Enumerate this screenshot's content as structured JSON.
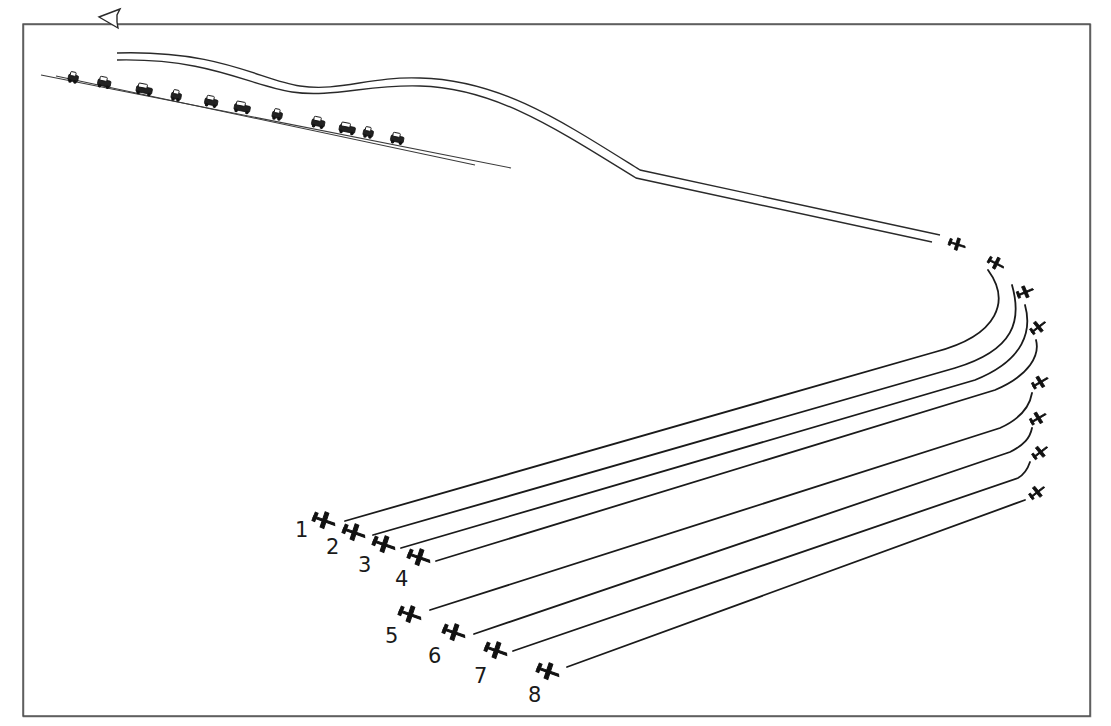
{
  "diagram": {
    "type": "line-art illustration",
    "colors": {
      "ink": "#111111",
      "frame": "#4a4a4a",
      "background": "#ffffff"
    },
    "frame": {
      "x": 23,
      "y": 24,
      "width": 1067,
      "height": 692
    },
    "road": {
      "lines": [
        {
          "x1": 41,
          "y1": 75,
          "x2": 511,
          "y2": 168
        },
        {
          "x1": 56,
          "y1": 76,
          "x2": 475,
          "y2": 165
        }
      ],
      "vehicle_count": 12,
      "vehicles": [
        {
          "x": 73,
          "y": 79
        },
        {
          "x": 104,
          "y": 84
        },
        {
          "x": 144,
          "y": 91
        },
        {
          "x": 176,
          "y": 97
        },
        {
          "x": 211,
          "y": 103
        },
        {
          "x": 242,
          "y": 109
        },
        {
          "x": 277,
          "y": 116
        },
        {
          "x": 318,
          "y": 124
        },
        {
          "x": 347,
          "y": 130
        },
        {
          "x": 368,
          "y": 134
        },
        {
          "x": 397,
          "y": 140
        }
      ]
    },
    "egress_ribbon": {
      "description": "double-line flight path returning to the left, ending in an arrowhead",
      "outer": "M 117 53 C 220 50, 260 80, 300 86 C 340 92, 370 76, 420 78 C 500 80, 560 120, 640 170 L 940 235",
      "inner": "M 117 60 C 210 58, 250 86, 292 92 C 332 98, 370 84, 420 86 C 495 88, 555 128, 636 178 L 932 242",
      "arrowhead": "M 98 17 L 113 8 L 117 53 Z"
    },
    "turn_aircraft": [
      {
        "id": "t1",
        "x": 957,
        "y": 244,
        "rot": 20
      },
      {
        "id": "t2",
        "x": 996,
        "y": 263,
        "rot": 30
      },
      {
        "id": "t3",
        "x": 1025,
        "y": 292,
        "rot": -20
      },
      {
        "id": "t4",
        "x": 1038,
        "y": 327,
        "rot": -35
      },
      {
        "id": "t5",
        "x": 1040,
        "y": 382,
        "rot": -28
      },
      {
        "id": "t6",
        "x": 1038,
        "y": 418,
        "rot": -28
      },
      {
        "id": "t7",
        "x": 1040,
        "y": 452,
        "rot": -35
      },
      {
        "id": "t8",
        "x": 1037,
        "y": 492,
        "rot": -35
      }
    ],
    "tracks": [
      {
        "id": 1,
        "d": "M 345 521 L 935 352 C 1000 335, 1010 300, 988 270"
      },
      {
        "id": 2,
        "d": "M 373 535 L 955 368 C 1015 350, 1022 320, 1012 285"
      },
      {
        "id": 3,
        "d": "M 401 548 L 975 380 C 1025 360, 1032 330, 1025 305"
      },
      {
        "id": 4,
        "d": "M 436 561 L 995 390 C 1030 375, 1040 355, 1036 340"
      },
      {
        "id": 5,
        "d": "M 430 610 L 1000 428 C 1022 418, 1030 405, 1032 393"
      },
      {
        "id": 6,
        "d": "M 474 634 L 1010 452 C 1024 445, 1030 438, 1032 428"
      },
      {
        "id": 7,
        "d": "M 513 651 L 1018 478 C 1025 474, 1028 468, 1030 462"
      },
      {
        "id": 8,
        "d": "M 567 667 L 1025 500"
      }
    ],
    "attack_aircraft": [
      {
        "number": "1",
        "x": 324,
        "y": 520,
        "label_x": 295,
        "label_y": 537
      },
      {
        "number": "2",
        "x": 354,
        "y": 532,
        "label_x": 326,
        "label_y": 554
      },
      {
        "number": "3",
        "x": 384,
        "y": 544,
        "label_x": 358,
        "label_y": 572
      },
      {
        "number": "4",
        "x": 419,
        "y": 557,
        "label_x": 395,
        "label_y": 586
      },
      {
        "number": "5",
        "x": 410,
        "y": 614,
        "label_x": 385,
        "label_y": 643
      },
      {
        "number": "6",
        "x": 454,
        "y": 632,
        "label_x": 428,
        "label_y": 663
      },
      {
        "number": "7",
        "x": 496,
        "y": 650,
        "label_x": 474,
        "label_y": 683
      },
      {
        "number": "8",
        "x": 548,
        "y": 671,
        "label_x": 528,
        "label_y": 702
      }
    ]
  }
}
